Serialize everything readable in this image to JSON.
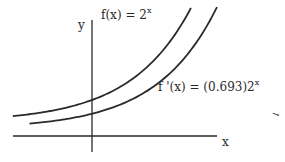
{
  "chart_data": {
    "type": "line",
    "title": "",
    "xlabel": "x",
    "ylabel": "y",
    "grid": false,
    "xlim": [
      -2.0,
      3.0
    ],
    "ylim": [
      -0.8,
      6.0
    ],
    "series": [
      {
        "name": "f(x) = 2^x",
        "label_main": "f(x) = 2",
        "label_exp": "x",
        "coefficient": 1.0,
        "base": 2,
        "x_range": [
          -1.9,
          2.6
        ]
      },
      {
        "name": "f'(x) = (0.693)2^x",
        "label_main": "f '(x) = (0.693)2",
        "label_exp": "x",
        "coefficient": 0.693,
        "base": 2,
        "x_range": [
          -1.5,
          3.0
        ]
      }
    ],
    "stray_mark": "→"
  },
  "colors": {
    "ink": "#2a2a2a",
    "background": "#ffffff"
  }
}
